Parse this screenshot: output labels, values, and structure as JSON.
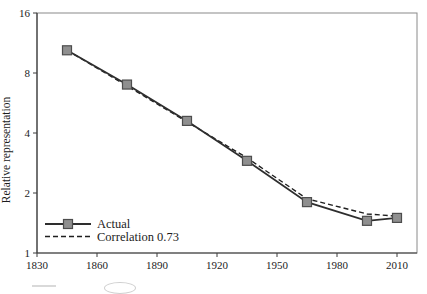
{
  "figure": {
    "ylabel": "Relative representation",
    "legend": {
      "actual_label": "Actual",
      "fitted_label": "Correlation 0.73"
    },
    "colors": {
      "line": "#2e2e2e",
      "dashed_line": "#1f1f1f",
      "marker_fill": "#8f8f8f",
      "marker_stroke": "#4d4d4d",
      "box_border": "#8a8a8a",
      "axis": "#3c3c3c",
      "text": "#1c1c1c"
    }
  },
  "chart_data": {
    "type": "line",
    "title": "",
    "xlabel": "",
    "ylabel": "Relative representation",
    "y_scale": "log2",
    "xlim": [
      1830,
      2020
    ],
    "ylim": [
      1,
      16
    ],
    "x_ticks": [
      1830,
      1860,
      1890,
      1920,
      1950,
      1980,
      2010
    ],
    "y_ticks": [
      1,
      2,
      4,
      8,
      16
    ],
    "grid": false,
    "legend_position": "lower-left",
    "series": [
      {
        "name": "Actual",
        "style": "solid",
        "marker": "square",
        "x": [
          1845,
          1875,
          1905,
          1935,
          1965,
          1995,
          2010
        ],
        "y": [
          10.4,
          7.0,
          4.6,
          2.9,
          1.8,
          1.45,
          1.5
        ]
      },
      {
        "name": "Correlation 0.73",
        "style": "dashed",
        "marker": "none",
        "x": [
          1845,
          1875,
          1905,
          1935,
          1965,
          1995,
          2010
        ],
        "y": [
          10.4,
          6.9,
          4.55,
          3.0,
          1.87,
          1.57,
          1.53
        ]
      }
    ]
  }
}
